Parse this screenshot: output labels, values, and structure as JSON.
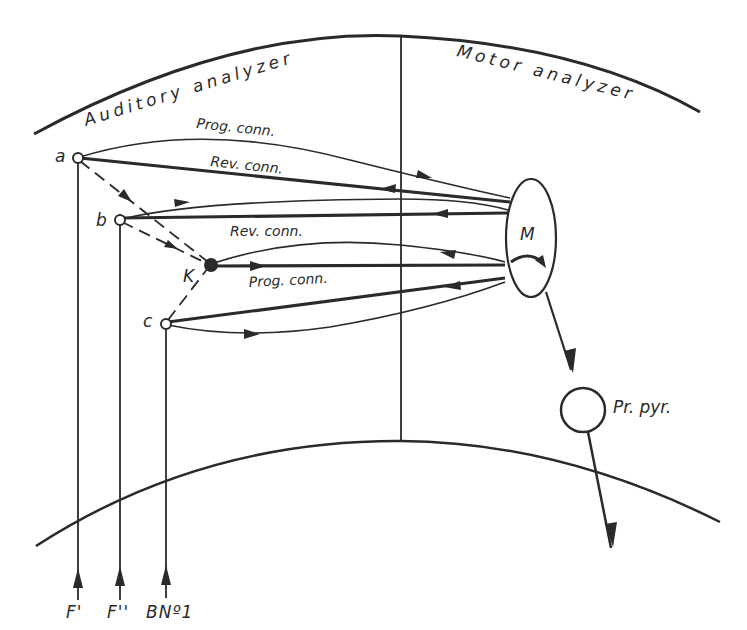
{
  "diagram": {
    "regions": {
      "left_label": "Auditory analyzer",
      "right_label": "Motor analyzer"
    },
    "connections": {
      "prog_top": "Prog. conn.",
      "rev_top": "Rev. conn.",
      "rev_mid": "Rev. conn.",
      "prog_mid": "Prog. conn."
    },
    "nodes": {
      "a": "a",
      "b": "b",
      "c": "c",
      "k": "K",
      "m": "M",
      "pr_pyr": "Pr. pyr."
    },
    "inputs": [
      {
        "label": "F'"
      },
      {
        "label": "F''"
      },
      {
        "label": "BNº1"
      }
    ],
    "colors": {
      "ink": "#2a2a2a",
      "background": "#ffffff"
    }
  }
}
